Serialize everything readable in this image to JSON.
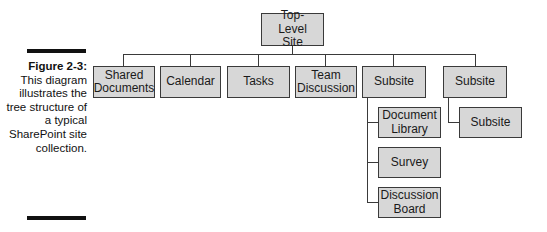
{
  "caption": {
    "figure_label": "Figure 2-3:",
    "text": "This diagram illustrates the tree structure of a typical SharePoint site collection."
  },
  "tree": {
    "root": {
      "label": "Top-Level Site"
    },
    "children": [
      {
        "label": "Shared Documents"
      },
      {
        "label": "Calendar"
      },
      {
        "label": "Tasks"
      },
      {
        "label": "Team Discussion"
      },
      {
        "label": "Subsite",
        "children": [
          {
            "label": "Document Library"
          },
          {
            "label": "Survey"
          },
          {
            "label": "Discussion Board"
          }
        ]
      },
      {
        "label": "Subsite",
        "children": [
          {
            "label": "Subsite"
          }
        ]
      }
    ]
  },
  "colors": {
    "box_fill": "#d7d7d7",
    "box_border": "#3a3a3a",
    "caption_bar": "#111111"
  }
}
